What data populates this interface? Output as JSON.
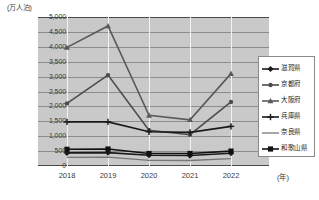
{
  "chart_data": {
    "type": "line",
    "title": "",
    "subtitle": "",
    "xlabel": "(年)",
    "ylabel": "(万人泊)",
    "y_unit_label": "(万人泊)",
    "x_unit_label": "(年)",
    "categories": [
      "2018",
      "2019",
      "2020",
      "2021",
      "2022"
    ],
    "x_tick_labels": [
      "2018",
      "2019",
      "2020",
      "2021",
      "2022"
    ],
    "y_tick_labels": [
      "0",
      "500",
      "1,000",
      "1,500",
      "2,000",
      "2,500",
      "3,000",
      "3,500",
      "4,000",
      "4,500",
      "5,000"
    ],
    "y_tick_values": [
      0,
      500,
      1000,
      1500,
      2000,
      2500,
      3000,
      3500,
      4000,
      4500,
      5000
    ],
    "ylim": [
      0,
      5000
    ],
    "grid": "horizontal-and-vertical",
    "legend_position": "right",
    "plot_background": "#c9c9c9",
    "series": [
      {
        "name": "滋賀県",
        "marker": "diamond",
        "color": "#1a1a1a",
        "values": [
          440,
          450,
          360,
          350,
          430
        ]
      },
      {
        "name": "京都府",
        "marker": "circle",
        "color": "#4d4d4d",
        "values": [
          2100,
          3050,
          1200,
          1050,
          2150
        ]
      },
      {
        "name": "大阪府",
        "marker": "triangle",
        "color": "#5a5a5a",
        "values": [
          3980,
          4700,
          1700,
          1550,
          3100
        ]
      },
      {
        "name": "兵庫県",
        "marker": "cross",
        "color": "#1a1a1a",
        "values": [
          1480,
          1480,
          1150,
          1130,
          1330
        ]
      },
      {
        "name": "奈良県",
        "marker": "none",
        "color": "#777777",
        "values": [
          290,
          300,
          190,
          185,
          250
        ]
      },
      {
        "name": "和歌山県",
        "marker": "square",
        "color": "#111111",
        "values": [
          560,
          570,
          420,
          420,
          500
        ]
      }
    ]
  },
  "legend": {
    "items": [
      {
        "label": "滋賀県"
      },
      {
        "label": "京都府"
      },
      {
        "label": "大阪府"
      },
      {
        "label": "兵庫県"
      },
      {
        "label": "奈良県"
      },
      {
        "label": "和歌山県"
      }
    ]
  }
}
